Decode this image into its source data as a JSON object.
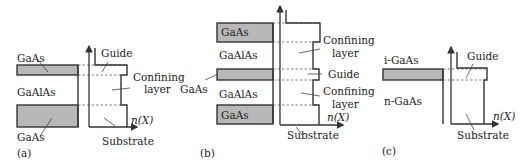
{
  "panels": {
    "a": {
      "label": "(a)",
      "layers": [
        "GaAs",
        "GaAlAs",
        "GaAs"
      ],
      "profile_labels": [
        "Guide",
        "Confining",
        "layer",
        "Substrate"
      ],
      "axis_label": "n(X)"
    },
    "b": {
      "label": "(b)",
      "layers": [
        "GaAs",
        "GaAlAs",
        "GaAs",
        "GaAlAs",
        "GaAs"
      ],
      "profile_labels": [
        "Confining",
        "layer",
        "Guide",
        "Confining",
        "layer",
        "Substrate"
      ],
      "axis_label": "n(X)"
    },
    "c": {
      "label": "(c)",
      "layers": [
        "i-GaAs",
        "n-GaAs"
      ],
      "profile_labels": [
        "Guide",
        "Substrate"
      ],
      "axis_label": "n(X)"
    }
  }
}
